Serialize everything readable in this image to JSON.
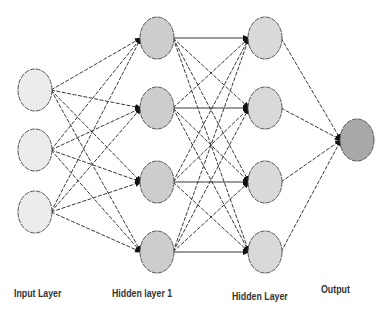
{
  "diagram": {
    "type": "feedforward-neural-network",
    "colors": {
      "input_fill": "#ececec",
      "hidden1_fill": "#cdcdcd",
      "hidden2_fill": "#d9d9d9",
      "output_fill": "#a9a9a9",
      "stroke": "#555555",
      "edge": "#222222",
      "background": "#ffffff"
    },
    "layers": [
      {
        "id": "input",
        "label": "Input Layer",
        "x": 35,
        "nodes": [
          90,
          150,
          212
        ],
        "fill": "#ececec",
        "label_x": 14,
        "label_y": 288
      },
      {
        "id": "hidden1",
        "label": "Hidden layer 1",
        "x": 157,
        "nodes": [
          38,
          108,
          182,
          252
        ],
        "fill": "#cdcdcd",
        "label_x": 112,
        "label_y": 288
      },
      {
        "id": "hidden2",
        "label": "Hidden Layer",
        "x": 265,
        "nodes": [
          38,
          108,
          182,
          252
        ],
        "fill": "#d9d9d9",
        "label_x": 232,
        "label_y": 291
      },
      {
        "id": "output",
        "label": "Output",
        "x": 357,
        "nodes": [
          140
        ],
        "fill": "#a9a9a9",
        "label_x": 321,
        "label_y": 284
      }
    ],
    "node_rx": 17,
    "node_ry": 21,
    "connections": "fully-connected between adjacent layers, arrowheads pointing right"
  }
}
